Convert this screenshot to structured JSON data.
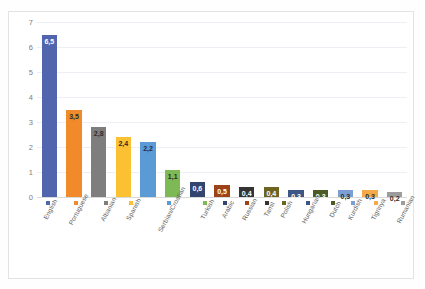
{
  "top_ghost_text": "",
  "chart_data": {
    "type": "bar",
    "title": "",
    "subtitle": "",
    "xlabel": "",
    "ylabel": "",
    "ylim": [
      0,
      7
    ],
    "yticks": [
      "0",
      "1",
      "2",
      "3",
      "4",
      "5",
      "6",
      "7"
    ],
    "grid": true,
    "legend_position": "x-axis-inline",
    "value_label_position": "inside-top",
    "categories": [
      "English",
      "Portuguese",
      "Albanian",
      "Spanish",
      "Serbian/Croatian",
      "Turkish",
      "Arabic",
      "Russian",
      "Tamil",
      "Polish",
      "Hungarian",
      "Dutch",
      "Kurdish",
      "Tigrinya",
      "Rumanian"
    ],
    "values": [
      6.5,
      3.5,
      2.8,
      2.4,
      2.2,
      1.1,
      0.6,
      0.5,
      0.4,
      0.4,
      0.3,
      0.3,
      0.3,
      0.3,
      0.2
    ],
    "value_labels": [
      "6,5",
      "3,5",
      "2,8",
      "2,4",
      "2,2",
      "1,1",
      "0,6",
      "0,5",
      "0,4",
      "0,4",
      "0,3",
      "0,3",
      "0,3",
      "0,3",
      "0,2"
    ],
    "colors": [
      "#5165AE",
      "#F08A2B",
      "#7E7E7E",
      "#FCC132",
      "#5B9BD5",
      "#7DB954",
      "#32456F",
      "#9C4418",
      "#343434",
      "#6E6320",
      "#3D5685",
      "#4C5B23",
      "#7B9FD4",
      "#F5A949",
      "#9C9C9C"
    ],
    "label_text_is_light": [
      true,
      false,
      false,
      false,
      false,
      false,
      true,
      true,
      true,
      true,
      true,
      true,
      false,
      false,
      false
    ]
  }
}
